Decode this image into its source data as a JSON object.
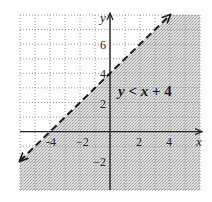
{
  "chart_data": {
    "type": "line",
    "title": "",
    "inequality": "y < x + 4",
    "inequality_parts": {
      "lhs": "y",
      "op": "<",
      "rhs_var": "x",
      "rhs_rest": "+ 4"
    },
    "boundary_line": {
      "slope": 1,
      "intercept": 4,
      "style": "dashed",
      "points": [
        [
          -6,
          -2
        ],
        [
          4,
          8
        ]
      ]
    },
    "shaded_region": "below boundary line (y < x + 4)",
    "xlabel": "x",
    "ylabel": "y",
    "xlim": [
      -6,
      6
    ],
    "ylim": [
      -4,
      8
    ],
    "x_ticks": [
      -4,
      -2,
      2,
      4
    ],
    "x_tick_labels": [
      "-4",
      "−2",
      "2",
      "4"
    ],
    "y_ticks": [
      6,
      4,
      2,
      -2
    ],
    "y_tick_labels": [
      "6",
      "4",
      "2",
      "−2"
    ],
    "grid": true,
    "grid_step": 1,
    "legend": null
  },
  "colors": {
    "shade": "#cdcdcd",
    "grid": "#9a9a9a",
    "axis": "#222222",
    "line": "#1a1a1a"
  }
}
